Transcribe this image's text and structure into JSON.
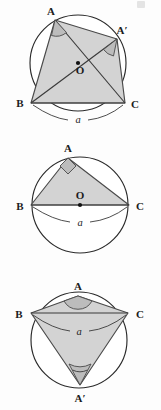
{
  "page": {
    "background_color": "#fdfdfd",
    "width": 161,
    "height": 410
  },
  "style": {
    "shade_color": "#d3d3d3",
    "arc_fill_color": "#bcbcbc",
    "stroke_color": "#3a3a3a",
    "circle_fill": "#ffffff",
    "dot_color": "#111111"
  },
  "figures": [
    {
      "id": "figure-1",
      "caption": "Acute inscribed angles A and A' subtending chord a, center O marked",
      "labels": {
        "vertex_a": "A",
        "vertex_a_prime": "A′",
        "vertex_b": "B",
        "vertex_c": "C",
        "center": "O",
        "chord": "a"
      },
      "geometry": {
        "circle_center": [
          78,
          55
        ],
        "circle_radius": 48,
        "point_a": [
          55,
          12
        ],
        "point_a_prime": [
          117,
          31
        ],
        "point_b": [
          31,
          95
        ],
        "point_c": [
          125,
          95
        ],
        "center_point": [
          78,
          55
        ]
      },
      "angle_markers": [
        {
          "at": "A",
          "type": "arc",
          "kind": "acute"
        },
        {
          "at": "A′",
          "type": "arc",
          "kind": "acute"
        }
      ]
    },
    {
      "id": "figure-2",
      "caption": "Right inscribed angle at A, chord a is a diameter through center O",
      "labels": {
        "vertex_a": "A",
        "vertex_b": "B",
        "vertex_c": "C",
        "center": "O",
        "chord": "a"
      },
      "geometry": {
        "circle_center": [
          80,
          65
        ],
        "circle_radius": 48,
        "point_a": [
          68,
          18
        ],
        "point_b": [
          31,
          65
        ],
        "point_c": [
          129,
          65
        ],
        "center_point": [
          80,
          65
        ]
      },
      "angle_markers": [
        {
          "at": "A",
          "type": "square",
          "kind": "right"
        }
      ]
    },
    {
      "id": "figure-3",
      "caption": "Obtuse angle at A and acute angle at A' on opposite arcs of chord a",
      "labels": {
        "vertex_a": "A",
        "vertex_a_prime": "A′",
        "vertex_b": "B",
        "vertex_c": "C",
        "chord": "a"
      },
      "geometry": {
        "circle_center": [
          79,
          68
        ],
        "circle_radius": 48,
        "point_a": [
          78,
          24
        ],
        "point_a_prime": [
          80,
          113
        ],
        "point_b": [
          31,
          41
        ],
        "point_c": [
          128,
          41
        ]
      },
      "angle_markers": [
        {
          "at": "A",
          "type": "arc",
          "kind": "obtuse"
        },
        {
          "at": "A′",
          "type": "double-arc",
          "kind": "acute"
        }
      ]
    }
  ]
}
